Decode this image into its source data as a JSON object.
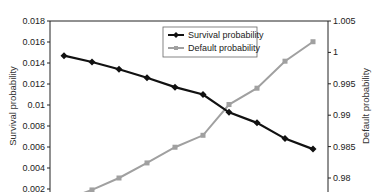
{
  "chart_data": {
    "type": "line",
    "title": "",
    "xlabel": "",
    "x": [
      1,
      2,
      3,
      4,
      5,
      6,
      7,
      8,
      9,
      10
    ],
    "series": [
      {
        "name": "Survival probability",
        "axis": "left",
        "color": "#111111",
        "marker": "diamond",
        "values": [
          0.0147,
          0.0141,
          0.0134,
          0.0126,
          0.0117,
          0.011,
          0.0093,
          0.0083,
          0.0068,
          0.0058
        ]
      },
      {
        "name": "Default probability",
        "axis": "right",
        "color": "#a0a0a0",
        "marker": "square",
        "values": [
          0.9765,
          0.9781,
          0.98,
          0.9824,
          0.9849,
          0.9868,
          0.9917,
          0.9943,
          0.9986,
          1.0017
        ]
      }
    ],
    "ylabel": "Survival probability",
    "ylabel_right": "Default probability",
    "ylim": [
      0.002,
      0.018
    ],
    "ylim_right": [
      0.98,
      1.005
    ],
    "yticks": [
      "0.018",
      "0.016",
      "0.014",
      "0.012",
      "0.01",
      "0.008",
      "0.006",
      "0.004",
      "0.002"
    ],
    "yticks_right": [
      "1.005",
      "1",
      "0.995",
      "0.99",
      "0.985",
      "0.98"
    ],
    "grid": false,
    "legend_position": "upper center"
  }
}
